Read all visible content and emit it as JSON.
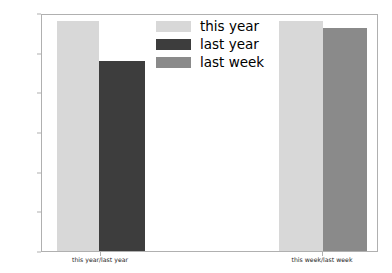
{
  "chart_data": {
    "type": "bar",
    "title": "",
    "xlabel": "",
    "ylabel": "",
    "categories": [
      "this year/last year",
      "this week/last week"
    ],
    "ylim": [
      0,
      600000
    ],
    "yticks": [
      0,
      100000,
      200000,
      300000,
      400000,
      500000,
      600000
    ],
    "ytick_labels": [
      "0",
      "100000",
      "200000",
      "300000",
      "400000",
      "500000",
      "600000"
    ],
    "grid": false,
    "legend_position": "upper center",
    "series": [
      {
        "name": "this year",
        "color": "#d8d8d8",
        "values": [
          580000,
          580000
        ]
      },
      {
        "name": "last year",
        "color": "#3d3d3d",
        "values": [
          478000,
          null
        ]
      },
      {
        "name": "last week",
        "color": "#8a8a8a",
        "values": [
          null,
          562000
        ]
      }
    ],
    "bars": [
      {
        "label": "this year",
        "group": "this year/last year",
        "value": 580000,
        "color": "#d8d8d8",
        "x": 56,
        "width": 42
      },
      {
        "label": "last year",
        "group": "this year/last year",
        "value": 478000,
        "color": "#3d3d3d",
        "x": 98,
        "width": 46
      },
      {
        "label": "this year",
        "group": "this week/last week",
        "value": 580000,
        "color": "#d8d8d8",
        "x": 278,
        "width": 44
      },
      {
        "label": "last week",
        "group": "this week/last week",
        "value": 562000,
        "color": "#8a8a8a",
        "x": 322,
        "width": 44
      }
    ],
    "group_centers": [
      100,
      322
    ],
    "legend": [
      {
        "label": "this year",
        "color": "#d8d8d8"
      },
      {
        "label": "last year",
        "color": "#3d3d3d"
      },
      {
        "label": "last week",
        "color": "#8a8a8a"
      }
    ],
    "axis_color": "#b0b0b0",
    "tick_text_color": "#262626",
    "background": "#ffffff"
  }
}
